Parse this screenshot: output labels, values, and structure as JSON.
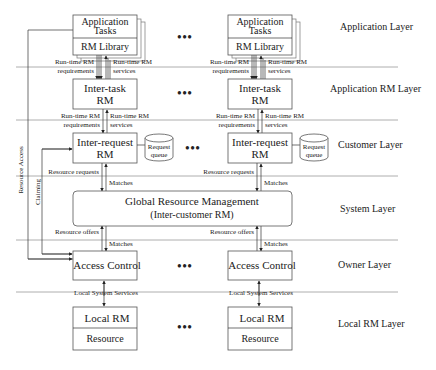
{
  "layers": [
    {
      "label": "Application Layer"
    },
    {
      "label": "Application RM Layer"
    },
    {
      "label": "Customer Layer"
    },
    {
      "label": "System Layer"
    },
    {
      "label": "Owner Layer"
    },
    {
      "label": "Local RM Layer"
    }
  ],
  "columns": [
    {
      "app_tasks": [
        "Application",
        "Tasks"
      ],
      "rm_library": "RM Library",
      "req1": [
        "Run-time RM",
        "requirements"
      ],
      "svc1": [
        "Run-time RM",
        "services"
      ],
      "inter_task": [
        "Inter-task",
        "RM"
      ],
      "req2": [
        "Run-time RM",
        "requirements"
      ],
      "svc2": [
        "Run-time RM",
        "services"
      ],
      "inter_request": [
        "Inter-request",
        "RM"
      ],
      "queue": [
        "Request",
        "queue"
      ],
      "resource_requests": "Resource requests",
      "matches_top": "Matches",
      "resource_offers": "Resource offers",
      "matches_bottom": "Matches",
      "access_control": "Access Control",
      "local_services": "Local System Services",
      "local_rm": "Local RM",
      "resource": "Resource"
    },
    {
      "app_tasks": [
        "Application",
        "Tasks"
      ],
      "rm_library": "RM Library",
      "req1": [
        "Run-time RM",
        "requirements"
      ],
      "svc1": [
        "Run-time RM",
        "services"
      ],
      "inter_task": [
        "Inter-task",
        "RM"
      ],
      "req2": [
        "Run-time RM",
        "requirements"
      ],
      "svc2": [
        "Run-time RM",
        "services"
      ],
      "inter_request": [
        "Inter-request",
        "RM"
      ],
      "queue": [
        "Request",
        "queue"
      ],
      "resource_requests": "Resource requests",
      "matches_top": "Matches",
      "resource_offers": "Resource offers",
      "matches_bottom": "Matches",
      "access_control": "Access Control",
      "local_services": "Local System Services",
      "local_rm": "Local RM",
      "resource": "Resource"
    }
  ],
  "global_rm": [
    "Global Resource Management",
    "(Inter-customer RM)"
  ],
  "side_labels": {
    "resource_access": "Resource Access",
    "claiming": "Claiming"
  },
  "ellipsis": "•••"
}
